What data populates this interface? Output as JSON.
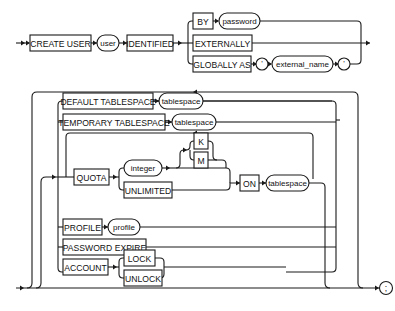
{
  "diagram": {
    "top": {
      "create_user": "CREATE USER",
      "user": "user",
      "identified": "IDENTIFIED",
      "by": "BY",
      "password": "password",
      "externally": "EXTERNALLY",
      "globally_as": "GLOBALLY AS",
      "quote_open": "'",
      "external_name": "external_name",
      "quote_close": "'"
    },
    "options": {
      "default_tablespace": "DEFAULT TABLESPACE",
      "default_tablespace_value": "tablespace",
      "temporary_tablespace": "TEMPORARY TABLESPACE",
      "temporary_tablespace_value": "tablespace",
      "quota": "QUOTA",
      "integer": "integer",
      "k": "K",
      "m": "M",
      "unlimited": "UNLIMITED",
      "on": "ON",
      "quota_tablespace": "tablespace",
      "profile": "PROFILE",
      "profile_value": "profile",
      "password_expire": "PASSWORD EXPIRE",
      "account": "ACCOUNT",
      "lock": "LOCK",
      "unlock": "UNLOCK",
      "terminator": ";"
    },
    "colors": {
      "line": "#1a1a1a",
      "background": "#ffffff"
    }
  }
}
